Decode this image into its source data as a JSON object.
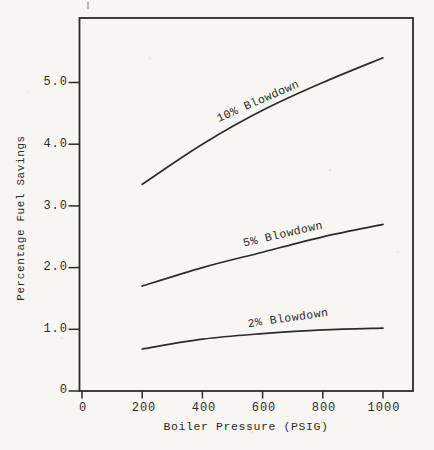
{
  "chart_data": {
    "type": "line",
    "title": "",
    "xlabel": "Boiler Pressure (PSIG)",
    "ylabel": "Percentage Fuel Savings",
    "x": [
      200,
      400,
      600,
      800,
      1000
    ],
    "series": [
      {
        "name": "10% Blowdown",
        "values": [
          3.35,
          4.0,
          4.55,
          5.0,
          5.4
        ]
      },
      {
        "name": "5% Blowdown",
        "values": [
          1.7,
          2.0,
          2.25,
          2.5,
          2.7
        ]
      },
      {
        "name": "2% Blowdown",
        "values": [
          0.68,
          0.84,
          0.93,
          0.99,
          1.02
        ]
      }
    ],
    "xlim": [
      0,
      1100
    ],
    "ylim": [
      0,
      6.05
    ],
    "x_ticks": [
      "0",
      "200",
      "400",
      "600",
      "800",
      "1000"
    ],
    "y_ticks": [
      "0",
      "1.0",
      "2.0",
      "3.0",
      "4.0",
      "5.0"
    ],
    "grid": false,
    "legend_position": "inline-curve-labels",
    "line_color": "#2b2b2b",
    "paper_color": "#f7f6f2"
  }
}
